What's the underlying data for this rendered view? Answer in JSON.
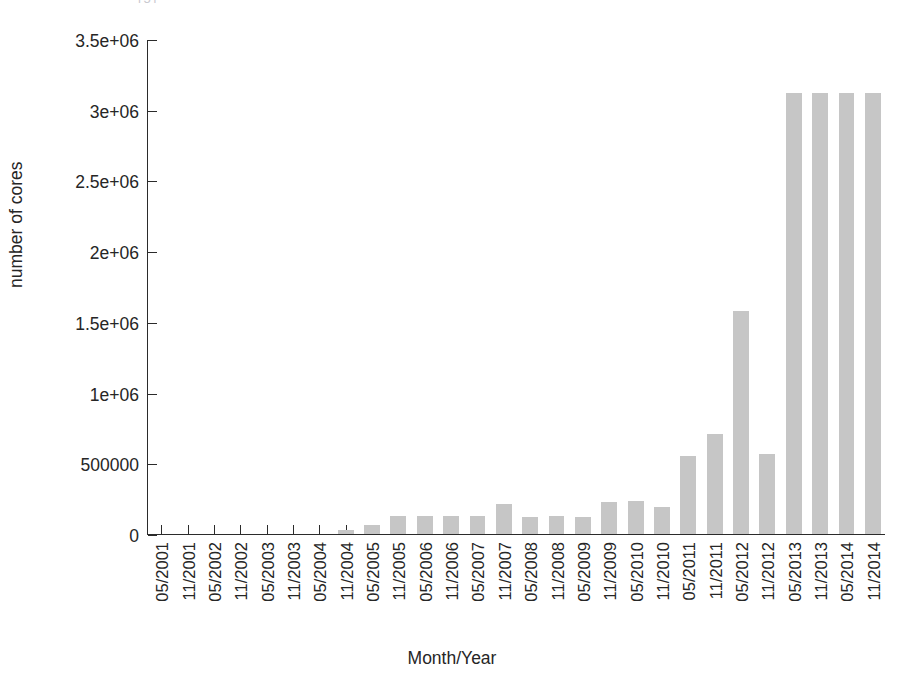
{
  "clipped_caption": "[5]",
  "chart_data": {
    "type": "bar",
    "title": "",
    "xlabel": "Month/Year",
    "ylabel": "number of cores",
    "grid": false,
    "legend": "none",
    "bar_color": "#c6c6c6",
    "axis_color": "#2b2b2b",
    "background": "#ffffff",
    "ylim": [
      0,
      3500000
    ],
    "ytick_values": [
      0,
      500000,
      1000000,
      1500000,
      2000000,
      2500000,
      3000000,
      3500000
    ],
    "ytick_labels": [
      "0",
      "500000",
      "1e+06",
      "1.5e+06",
      "2e+06",
      "2.5e+06",
      "3e+06",
      "3.5e+06"
    ],
    "categories": [
      "05/2001",
      "11/2001",
      "05/2002",
      "11/2002",
      "05/2003",
      "11/2003",
      "05/2004",
      "11/2004",
      "05/2005",
      "11/2005",
      "05/2006",
      "11/2006",
      "05/2007",
      "11/2007",
      "05/2008",
      "11/2008",
      "05/2009",
      "11/2009",
      "05/2010",
      "11/2010",
      "05/2011",
      "11/2011",
      "05/2012",
      "11/2012",
      "05/2013",
      "11/2013",
      "05/2014",
      "11/2014"
    ],
    "values": [
      0,
      0,
      0,
      0,
      0,
      0,
      0,
      30000,
      65000,
      130000,
      130000,
      128000,
      130000,
      215000,
      120000,
      125000,
      122000,
      228000,
      232000,
      190000,
      550000,
      705000,
      1580000,
      565000,
      3120000,
      3120000,
      3120000,
      3120000
    ]
  }
}
